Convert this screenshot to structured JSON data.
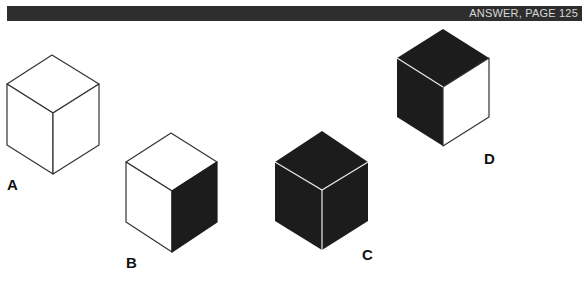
{
  "header": {
    "answer_ref": "ANSWER, PAGE 125",
    "bar_color": "#2e2e2e"
  },
  "cubes": [
    {
      "label": "A",
      "top": "white",
      "left": "white",
      "right": "white"
    },
    {
      "label": "B",
      "top": "white",
      "left": "white",
      "right": "black"
    },
    {
      "label": "C",
      "top": "black",
      "left": "black",
      "right": "black"
    },
    {
      "label": "D",
      "top": "black",
      "left": "black",
      "right": "white"
    }
  ],
  "colors": {
    "dark": "#1c1c1c",
    "light": "#ffffff",
    "edge": "#333333"
  }
}
